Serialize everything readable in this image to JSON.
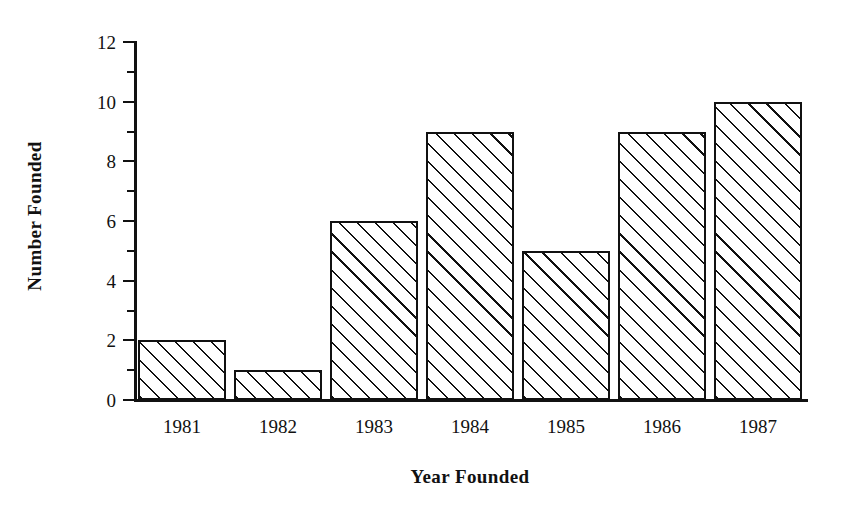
{
  "chart_data": {
    "type": "bar",
    "title": "",
    "subtitle": "",
    "xlabel": "Year Founded",
    "ylabel": "Number Founded",
    "categories": [
      "1981",
      "1982",
      "1983",
      "1984",
      "1985",
      "1986",
      "1987"
    ],
    "values": [
      2,
      1,
      6,
      9,
      5,
      9,
      10
    ],
    "series": [
      {
        "name": "Number Founded",
        "values": [
          2,
          1,
          6,
          9,
          5,
          9,
          10
        ]
      }
    ],
    "ylim": [
      0,
      12
    ],
    "y_major_ticks": [
      0,
      2,
      4,
      6,
      8,
      10,
      12
    ],
    "y_minor_ticks": [
      1,
      3,
      5,
      7,
      9,
      11
    ],
    "y_tick_labels": [
      "0",
      "2",
      "4",
      "6",
      "8",
      "10",
      "12"
    ],
    "grid": false,
    "legend": false,
    "legend_position": "none",
    "annotations": [],
    "bar_fill": "hatched-diagonal-45",
    "bar_edge_color": "#111111",
    "bar_face_color": "#ffffff",
    "background_color": "#ffffff",
    "axis_color": "#111111"
  }
}
